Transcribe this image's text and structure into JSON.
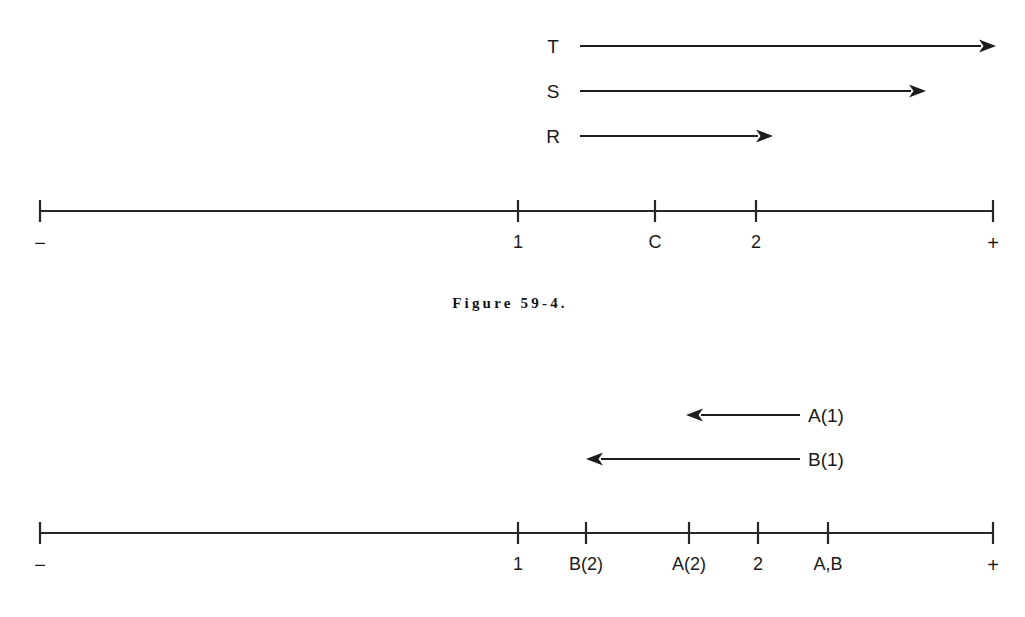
{
  "figure": {
    "caption": "Figure 59-4.",
    "caption_x": 510,
    "caption_y": 296
  },
  "chart_data": {
    "type": "diagram",
    "title": "Figure 59-4.",
    "panels": [
      {
        "id": "top-panel",
        "axis": {
          "y": 211,
          "x_start": 40,
          "x_end": 993,
          "left_end_label": "−",
          "right_end_label": "+",
          "ticks": [
            {
              "label": "−",
              "x": 40
            },
            {
              "label": "1",
              "x": 518
            },
            {
              "label": "C",
              "x": 655
            },
            {
              "label": "2",
              "x": 756
            },
            {
              "label": "+",
              "x": 993
            }
          ]
        },
        "vectors": [
          {
            "label": "T",
            "label_x": 553,
            "y": 46,
            "tail_x": 580,
            "tip_x": 996,
            "direction": "right"
          },
          {
            "label": "S",
            "label_x": 553,
            "y": 91,
            "tail_x": 580,
            "tip_x": 926,
            "direction": "right"
          },
          {
            "label": "R",
            "label_x": 553,
            "y": 136,
            "tail_x": 580,
            "tip_x": 773,
            "direction": "right"
          }
        ]
      },
      {
        "id": "bottom-panel",
        "axis": {
          "y": 533,
          "x_start": 40,
          "x_end": 993,
          "left_end_label": "−",
          "right_end_label": "+",
          "ticks": [
            {
              "label": "−",
              "x": 40
            },
            {
              "label": "1",
              "x": 518
            },
            {
              "label": "B(2)",
              "x": 586
            },
            {
              "label": "A(2)",
              "x": 689
            },
            {
              "label": "2",
              "x": 758
            },
            {
              "label": "A,B",
              "x": 828
            },
            {
              "label": "+",
              "x": 993
            }
          ]
        },
        "vectors": [
          {
            "label": "A(1)",
            "label_x": 808,
            "y": 415,
            "tail_x": 800,
            "tip_x": 686,
            "direction": "left"
          },
          {
            "label": "B(1)",
            "label_x": 808,
            "y": 459,
            "tail_x": 800,
            "tip_x": 586,
            "direction": "left"
          }
        ]
      }
    ]
  }
}
